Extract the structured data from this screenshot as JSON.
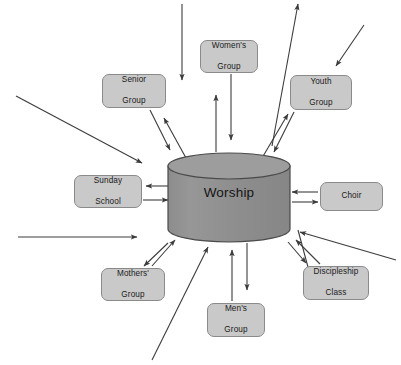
{
  "diagram": {
    "title_fragment": "",
    "center": {
      "label": "Worship",
      "shape": "cylinder",
      "fill_color": "#8f8f8f",
      "top_fill_color": "#9a9a9a",
      "stroke_color": "#4a4a4a"
    },
    "node_style": {
      "fill_color": "#c9c9c9",
      "stroke_color": "#8a8a8a",
      "text_color": "#1a1a1a"
    },
    "arrow_color": "#3c3c3c",
    "nodes": [
      {
        "id": "womens-group",
        "label": "Women's\nGroup",
        "line1": "Women's",
        "line2": "Group",
        "x": 200,
        "y": 40,
        "w": 58,
        "h": 33
      },
      {
        "id": "senior-group",
        "label": "Senior\nGroup",
        "line1": "Senior",
        "line2": "Group",
        "x": 102,
        "y": 74,
        "w": 64,
        "h": 34
      },
      {
        "id": "youth-group",
        "label": "Youth\nGroup",
        "line1": "Youth",
        "line2": "Group",
        "x": 290,
        "y": 75,
        "w": 62,
        "h": 35
      },
      {
        "id": "sunday-school",
        "label": "Sunday\nSchool",
        "line1": "Sunday",
        "line2": "School",
        "x": 74,
        "y": 175,
        "w": 68,
        "h": 33
      },
      {
        "id": "choir",
        "label": "Choir",
        "line1": "Choir",
        "line2": "",
        "x": 320,
        "y": 182,
        "w": 63,
        "h": 29
      },
      {
        "id": "mothers-group",
        "label": "Mothers'\nGroup",
        "line1": "Mothers'",
        "line2": "Group",
        "x": 101,
        "y": 268,
        "w": 64,
        "h": 33
      },
      {
        "id": "mens-group",
        "label": "Men's\nGroup",
        "line1": "Men's",
        "line2": "Group",
        "x": 207,
        "y": 303,
        "w": 58,
        "h": 34
      },
      {
        "id": "discipleship-class",
        "label": "Discipleship\nClass",
        "line1": "Discipleship",
        "line2": "Class",
        "x": 303,
        "y": 266,
        "w": 66,
        "h": 34
      }
    ],
    "external_arrows": [
      {
        "id": "top-center-inbound",
        "direction": "inbound"
      },
      {
        "id": "top-left-inbound",
        "direction": "inbound"
      },
      {
        "id": "top-right-inbound",
        "direction": "inbound"
      },
      {
        "id": "upper-right-outbound",
        "direction": "outbound"
      },
      {
        "id": "left-inbound",
        "direction": "inbound"
      },
      {
        "id": "right-inbound",
        "direction": "inbound"
      },
      {
        "id": "bottom-left-inbound",
        "direction": "inbound"
      },
      {
        "id": "bottom-center-outbound",
        "direction": "outbound"
      },
      {
        "id": "bottom-right-outbound",
        "direction": "outbound"
      }
    ]
  }
}
